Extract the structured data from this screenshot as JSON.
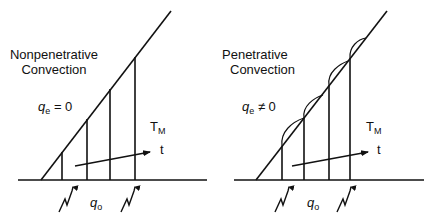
{
  "panels": [
    {
      "id": "nonpenetrative",
      "title_line1": "Nonpenetrative",
      "title_line2": "Convection",
      "entrainment_label": "q",
      "entrainment_sub": "e",
      "entrainment_relation": "= 0",
      "temperature_label": "T",
      "temperature_sub": "M",
      "time_label": "t",
      "surface_flux_label": "q",
      "surface_flux_sub": "o"
    },
    {
      "id": "penetrative",
      "title_line1": "Penetrative",
      "title_line2": "Convection",
      "entrainment_label": "q",
      "entrainment_sub": "e",
      "entrainment_relation": "≠ 0",
      "temperature_label": "T",
      "temperature_sub": "M",
      "time_label": "t",
      "surface_flux_label": "q",
      "surface_flux_sub": "o"
    }
  ],
  "colors": {
    "line": "#111111",
    "background": "#ffffff"
  }
}
